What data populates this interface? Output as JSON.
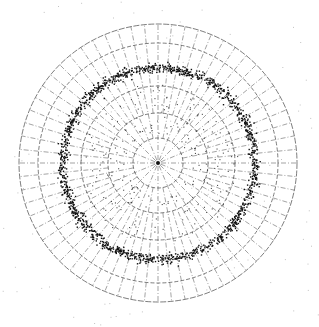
{
  "figure": {
    "center": [
      158,
      163
    ],
    "grid": {
      "circle_radii": [
        25,
        50,
        77,
        120,
        139
      ],
      "radial_spokes": 64,
      "line_color": "#333333"
    },
    "ring": {
      "radius": 96,
      "thickness": 5,
      "point_count": 1400,
      "color": "#111111"
    },
    "inner_scatter": {
      "radius_min": 30,
      "radius_max": 80,
      "point_count": 260,
      "color": "#222222"
    },
    "background_noise": {
      "point_count": 120,
      "color": "#999999"
    }
  }
}
